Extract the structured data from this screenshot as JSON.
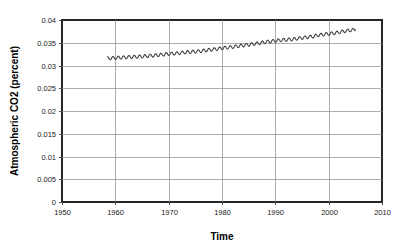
{
  "chart_data": {
    "type": "line",
    "title": "",
    "subtitle": "",
    "xlabel": "Time",
    "ylabel": "Atmospheric CO2  (percent)",
    "xlim": [
      1950,
      2010
    ],
    "ylim": [
      0,
      0.04
    ],
    "grid": true,
    "legend": "none",
    "xticks": [
      1950,
      1960,
      1970,
      1980,
      1990,
      2000,
      2010
    ],
    "xtick_labels": [
      "1950",
      "1960",
      "1970",
      "1980",
      "1990",
      "2000",
      "2010"
    ],
    "yticks": [
      0,
      0.005,
      0.01,
      0.015,
      0.02,
      0.025,
      0.03,
      0.035,
      0.04
    ],
    "ytick_labels": [
      "0",
      "0.005",
      "0.01",
      "0.015",
      "0.02",
      "0.025",
      "0.03",
      "0.035",
      "0.04"
    ],
    "series": [
      {
        "name": "Atmospheric CO2",
        "color": "#3a3a3a",
        "x_start": 1958.5,
        "x_end": 2005.0,
        "samples_per_year": 12,
        "annual_amplitude": 0.00035,
        "note": "Monthly mean CO2 as percent of atmosphere; annual values are yearly means, seasonal sawtooth superimposed",
        "annual_x": [
          1958,
          1959,
          1960,
          1961,
          1962,
          1963,
          1964,
          1965,
          1966,
          1967,
          1968,
          1969,
          1970,
          1971,
          1972,
          1973,
          1974,
          1975,
          1976,
          1977,
          1978,
          1979,
          1980,
          1981,
          1982,
          1983,
          1984,
          1985,
          1986,
          1987,
          1988,
          1989,
          1990,
          1991,
          1992,
          1993,
          1994,
          1995,
          1996,
          1997,
          1998,
          1999,
          2000,
          2001,
          2002,
          2003,
          2004,
          2005
        ],
        "annual_y": [
          0.03152,
          0.03159,
          0.03168,
          0.03174,
          0.03181,
          0.03188,
          0.03192,
          0.03199,
          0.03209,
          0.03218,
          0.03229,
          0.03241,
          0.03254,
          0.03262,
          0.03274,
          0.0329,
          0.03297,
          0.03308,
          0.03318,
          0.03334,
          0.03348,
          0.03364,
          0.03381,
          0.03396,
          0.03408,
          0.03427,
          0.03442,
          0.03459,
          0.03474,
          0.03493,
          0.03513,
          0.0353,
          0.03543,
          0.03557,
          0.03565,
          0.03573,
          0.0359,
          0.03607,
          0.03624,
          0.03637,
          0.03666,
          0.03683,
          0.03696,
          0.03711,
          0.03731,
          0.03755,
          0.03773,
          0.03787
        ]
      }
    ]
  },
  "axes": {
    "y_title": "Atmospheric CO2  (percent)",
    "x_title": "Time"
  }
}
